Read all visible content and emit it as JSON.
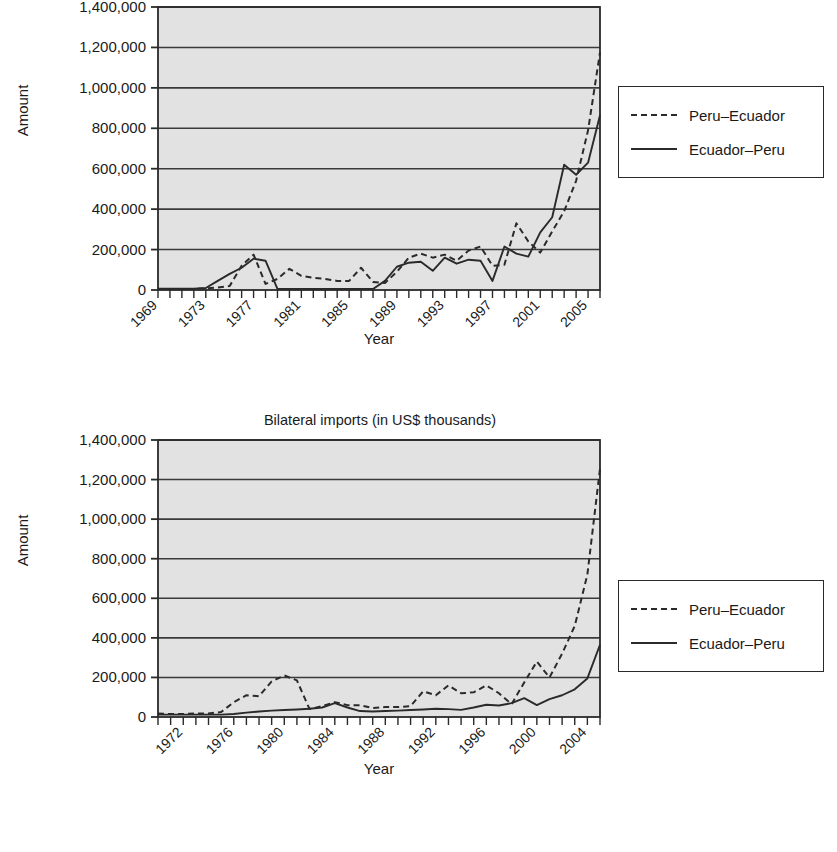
{
  "charts": [
    {
      "id": "exports",
      "title": "Bilateral exports (in US$ thousands)",
      "title_clipped": true,
      "ylabel": "Amount",
      "xlabel": "Year",
      "legend": [
        {
          "label": "Peru–Ecuador",
          "style": "dashed"
        },
        {
          "label": "Ecuador–Peru",
          "style": "solid"
        }
      ],
      "ytick_labels": [
        "1,400,000",
        "1,200,000",
        "1,000,000",
        "800,000",
        "600,000",
        "400,000",
        "200,000",
        "0"
      ],
      "xtick_labels": [
        "1969",
        "1973",
        "1977",
        "1981",
        "1985",
        "1989",
        "1993",
        "1997",
        "2001",
        "2005"
      ]
    },
    {
      "id": "imports",
      "title": "Bilateral imports (in US$ thousands)",
      "title_clipped": false,
      "ylabel": "Amount",
      "xlabel": "Year",
      "legend": [
        {
          "label": "Peru–Ecuador",
          "style": "dashed"
        },
        {
          "label": "Ecuador–Peru",
          "style": "solid"
        }
      ],
      "ytick_labels": [
        "1,400,000",
        "1,200,000",
        "1,000,000",
        "800,000",
        "600,000",
        "400,000",
        "200,000",
        "0"
      ],
      "xtick_labels": [
        "1972",
        "1976",
        "1980",
        "1984",
        "1988",
        "1992",
        "1996",
        "2000",
        "2004"
      ]
    }
  ],
  "chart_data": [
    {
      "type": "line",
      "id": "exports",
      "title": "Bilateral exports (in US$ thousands)",
      "xlabel": "Year",
      "ylabel": "Amount",
      "ylim": [
        0,
        1400000
      ],
      "ytick_values": [
        0,
        200000,
        400000,
        600000,
        800000,
        1000000,
        1200000,
        1400000
      ],
      "xlim": [
        1969,
        2006
      ],
      "xtick_values": [
        1969,
        1973,
        1977,
        1981,
        1985,
        1989,
        1993,
        1997,
        2001,
        2005
      ],
      "grid": "horizontal",
      "legend_position": "right",
      "x": [
        1969,
        1970,
        1971,
        1972,
        1973,
        1974,
        1975,
        1976,
        1977,
        1978,
        1979,
        1980,
        1981,
        1982,
        1983,
        1984,
        1985,
        1986,
        1987,
        1988,
        1989,
        1990,
        1991,
        1992,
        1993,
        1994,
        1995,
        1996,
        1997,
        1998,
        1999,
        2000,
        2001,
        2002,
        2003,
        2004,
        2005,
        2006
      ],
      "series": [
        {
          "name": "Peru–Ecuador",
          "style": "dashed",
          "values": [
            5000,
            5000,
            5000,
            5000,
            8000,
            12000,
            20000,
            120000,
            175000,
            30000,
            55000,
            105000,
            70000,
            60000,
            55000,
            45000,
            45000,
            110000,
            40000,
            35000,
            90000,
            160000,
            180000,
            160000,
            175000,
            145000,
            195000,
            215000,
            120000,
            125000,
            330000,
            240000,
            185000,
            290000,
            390000,
            540000,
            790000,
            1175000
          ]
        },
        {
          "name": "Ecuador–Peru",
          "style": "solid",
          "values": [
            6000,
            6000,
            6000,
            6000,
            10000,
            45000,
            80000,
            110000,
            155000,
            145000,
            5000,
            5000,
            5000,
            5000,
            5000,
            5000,
            5000,
            5000,
            5000,
            45000,
            115000,
            135000,
            140000,
            95000,
            160000,
            130000,
            150000,
            145000,
            45000,
            215000,
            180000,
            165000,
            285000,
            360000,
            620000,
            570000,
            630000,
            865000
          ]
        }
      ]
    },
    {
      "type": "line",
      "id": "imports",
      "title": "Bilateral imports (in US$ thousands)",
      "xlabel": "Year",
      "ylabel": "Amount",
      "ylim": [
        0,
        1400000
      ],
      "ytick_values": [
        0,
        200000,
        400000,
        600000,
        800000,
        1000000,
        1200000,
        1400000
      ],
      "xtick_values": [
        1972,
        1976,
        1980,
        1984,
        1988,
        1992,
        1996,
        2000,
        2004
      ],
      "xlim": [
        1970,
        2005
      ],
      "grid": "horizontal",
      "legend_position": "right",
      "x": [
        1970,
        1971,
        1972,
        1973,
        1974,
        1975,
        1976,
        1977,
        1978,
        1979,
        1980,
        1981,
        1982,
        1983,
        1984,
        1985,
        1986,
        1987,
        1988,
        1989,
        1990,
        1991,
        1992,
        1993,
        1994,
        1995,
        1996,
        1997,
        1998,
        1999,
        2000,
        2001,
        2002,
        2003,
        2004,
        2005
      ],
      "series": [
        {
          "name": "Peru–Ecuador",
          "style": "dashed",
          "values": [
            18000,
            15000,
            15000,
            18000,
            18000,
            25000,
            75000,
            110000,
            105000,
            180000,
            210000,
            185000,
            40000,
            55000,
            75000,
            60000,
            60000,
            45000,
            50000,
            50000,
            55000,
            130000,
            110000,
            160000,
            120000,
            125000,
            160000,
            120000,
            65000,
            175000,
            280000,
            200000,
            320000,
            460000,
            720000,
            1255000
          ]
        },
        {
          "name": "Ecuador–Peru",
          "style": "solid",
          "values": [
            12000,
            12000,
            12000,
            12000,
            12000,
            12000,
            15000,
            22000,
            28000,
            32000,
            35000,
            38000,
            42000,
            48000,
            70000,
            48000,
            30000,
            28000,
            30000,
            32000,
            35000,
            38000,
            42000,
            40000,
            36000,
            48000,
            62000,
            58000,
            70000,
            95000,
            60000,
            90000,
            110000,
            140000,
            195000,
            365000
          ]
        }
      ]
    }
  ]
}
